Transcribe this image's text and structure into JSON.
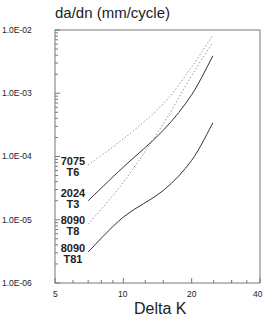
{
  "chart_data": {
    "type": "line",
    "title": "da/dn (mm/cycle)",
    "xlabel": "Delta K",
    "ylabel": "da/dn (mm/cycle)",
    "xscale": "log",
    "yscale": "log",
    "xlim": [
      5,
      40
    ],
    "ylim": [
      1e-06,
      0.01
    ],
    "x_ticks": [
      "5",
      "10",
      "20",
      "40"
    ],
    "y_ticks": [
      "1.0E-02",
      "1.0E-03",
      "1.0E-04",
      "1.0E-05",
      "1.0E-06"
    ],
    "grid": false,
    "legend": "inline labels at curve starts (left)",
    "x": [
      7.0,
      10,
      15,
      20,
      24.8
    ],
    "series": [
      {
        "name": "7075 T6",
        "label_line1": "7075",
        "label_line2": "T6",
        "style": "dotted",
        "values": [
          7.4e-05,
          0.00019,
          0.00068,
          0.0026,
          0.0083
        ]
      },
      {
        "name": "2024 T3",
        "label_line1": "2024",
        "label_line2": "T3",
        "style": "solid",
        "values": [
          2e-05,
          6.8e-05,
          0.00026,
          0.00095,
          0.0039
        ]
      },
      {
        "name": "8090 T8",
        "label_line1": "8090",
        "label_line2": "T8",
        "style": "dotted",
        "values": [
          8.5e-06,
          3.9e-05,
          0.00033,
          0.0019,
          0.0064
        ]
      },
      {
        "name": "8090 T81",
        "label_line1": "8090",
        "label_line2": "T81",
        "style": "solid",
        "values": [
          3.1e-06,
          1.1e-05,
          2.9e-05,
          8.7e-05,
          0.00034
        ]
      }
    ]
  }
}
